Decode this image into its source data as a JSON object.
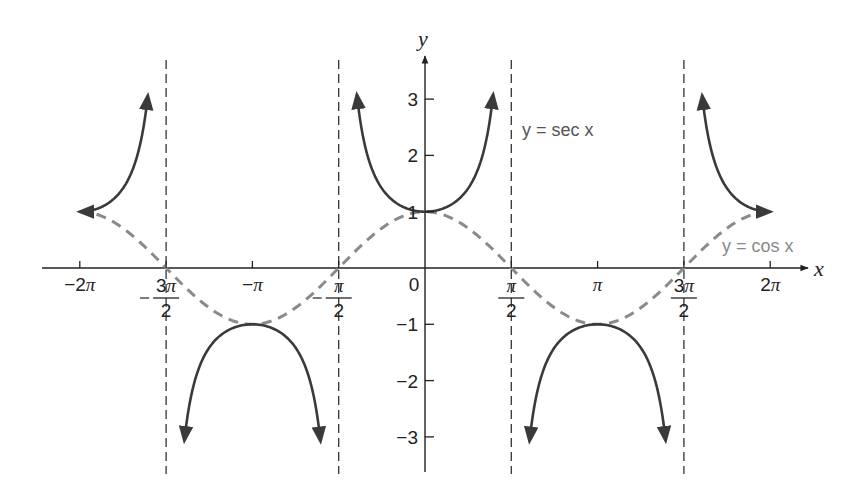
{
  "chart_data": {
    "type": "line",
    "title": "",
    "xlabel": "x",
    "ylabel": "y",
    "xlim": [
      -6.9,
      6.9
    ],
    "ylim": [
      -3.6,
      3.6
    ],
    "grid": false,
    "x_ticks": [
      {
        "value": -6.2832,
        "label": "−2π"
      },
      {
        "value": -4.7124,
        "label": "−3π/2"
      },
      {
        "value": -3.1416,
        "label": "−π"
      },
      {
        "value": -1.5708,
        "label": "−π/2"
      },
      {
        "value": 0,
        "label": "0"
      },
      {
        "value": 1.5708,
        "label": "π/2"
      },
      {
        "value": 3.1416,
        "label": "π"
      },
      {
        "value": 4.7124,
        "label": "3π/2"
      },
      {
        "value": 6.2832,
        "label": "2π"
      }
    ],
    "y_ticks": [
      {
        "value": 3,
        "label": "3"
      },
      {
        "value": 2,
        "label": "2"
      },
      {
        "value": 1,
        "label": "1"
      },
      {
        "value": -1,
        "label": "−1"
      },
      {
        "value": -2,
        "label": "−2"
      },
      {
        "value": -3,
        "label": "−3"
      }
    ],
    "asymptotes": [
      -4.7124,
      -1.5708,
      1.5708,
      4.7124
    ],
    "series": [
      {
        "name": "y = sec x",
        "style": "solid",
        "color": "#3a3a3a",
        "function": "sec",
        "branches": [
          [
            -6.2832,
            -5.045
          ],
          [
            -4.38,
            -1.902
          ],
          [
            -1.24,
            1.24
          ],
          [
            1.902,
            4.38
          ],
          [
            5.045,
            6.2832
          ]
        ]
      },
      {
        "name": "y = cos x",
        "style": "dashed",
        "color": "#8a8a8a",
        "function": "cos",
        "domain": [
          -6.2832,
          6.2832
        ]
      }
    ],
    "annotations": [
      {
        "text": "y = sec x",
        "x": 1.75,
        "y": 2.7
      },
      {
        "text": "y = cos x",
        "x": 5.25,
        "y": 0.4
      }
    ]
  },
  "labels": {
    "x_axis": "x",
    "y_axis": "y",
    "sec_label": "y = sec x",
    "cos_label": "y = cos x",
    "origin": "0"
  },
  "colors": {
    "axis": "#222222",
    "sec": "#3a3a3a",
    "cos": "#8a8a8a",
    "asymptote": "#333333"
  }
}
